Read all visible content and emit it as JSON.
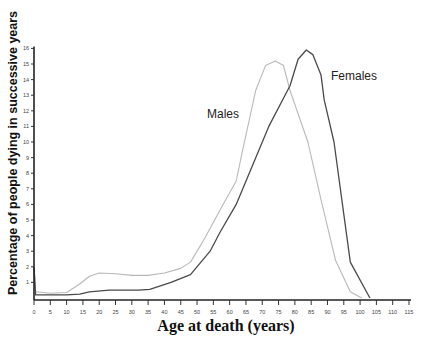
{
  "chart_data": {
    "type": "line",
    "title": "",
    "xlabel": "Age at death (years)",
    "ylabel": "Percentage of people dying in successive years",
    "xlim": [
      0,
      115
    ],
    "ylim": [
      0,
      16
    ],
    "x_ticks": [
      0,
      5,
      10,
      15,
      20,
      25,
      30,
      35,
      40,
      45,
      50,
      55,
      60,
      65,
      70,
      75,
      80,
      85,
      90,
      95,
      100,
      105,
      110,
      115
    ],
    "y_ticks": [
      1,
      2,
      3,
      4,
      5,
      6,
      7,
      8,
      9,
      10,
      11,
      12,
      13,
      14,
      15,
      16
    ],
    "grid": false,
    "legend": "inline labels",
    "series": [
      {
        "name": "Males",
        "color": "#b8b8b8",
        "label_pos": {
          "x": 225,
          "y": 115
        },
        "points": [
          [
            0,
            2.0
          ],
          [
            0.5,
            0.4
          ],
          [
            5,
            0.3
          ],
          [
            10,
            0.35
          ],
          [
            14,
            0.9
          ],
          [
            17,
            1.4
          ],
          [
            20,
            1.6
          ],
          [
            25,
            1.55
          ],
          [
            30,
            1.45
          ],
          [
            35,
            1.45
          ],
          [
            40,
            1.6
          ],
          [
            45,
            1.9
          ],
          [
            48,
            2.3
          ],
          [
            52,
            3.7
          ],
          [
            58,
            6.0
          ],
          [
            62,
            7.5
          ],
          [
            64,
            9.5
          ],
          [
            68,
            13.3
          ],
          [
            71,
            14.9
          ],
          [
            74,
            15.2
          ],
          [
            76.5,
            14.9
          ],
          [
            78.5,
            13.3
          ],
          [
            84,
            10.0
          ],
          [
            88,
            6.3
          ],
          [
            92.5,
            2.4
          ],
          [
            97,
            0.4
          ],
          [
            100.5,
            0
          ]
        ]
      },
      {
        "name": "Females",
        "color": "#4a4a4a",
        "label_pos": {
          "x": 356,
          "y": 77
        },
        "points": [
          [
            0,
            2.0
          ],
          [
            0.5,
            0.2
          ],
          [
            5,
            0.2
          ],
          [
            10,
            0.2
          ],
          [
            14,
            0.25
          ],
          [
            17,
            0.4
          ],
          [
            23,
            0.5
          ],
          [
            32,
            0.5
          ],
          [
            35.5,
            0.55
          ],
          [
            42,
            1.0
          ],
          [
            48,
            1.5
          ],
          [
            54,
            3.0
          ],
          [
            57,
            4.2
          ],
          [
            62,
            6.0
          ],
          [
            67,
            8.5
          ],
          [
            72,
            11.0
          ],
          [
            78.5,
            13.6
          ],
          [
            81,
            15.3
          ],
          [
            83.5,
            15.9
          ],
          [
            85.5,
            15.6
          ],
          [
            88,
            14.3
          ],
          [
            89,
            12.7
          ],
          [
            92,
            10.0
          ],
          [
            97,
            2.3
          ],
          [
            103,
            0
          ]
        ]
      }
    ]
  }
}
